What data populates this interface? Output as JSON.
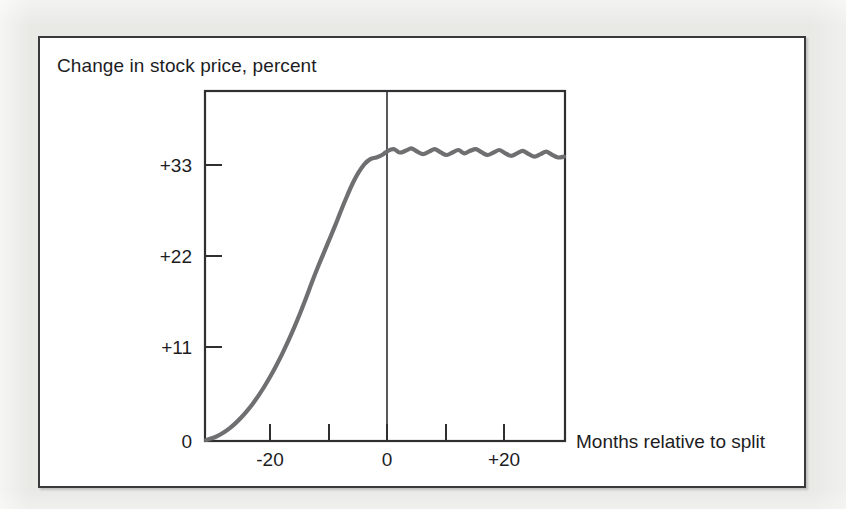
{
  "figure": {
    "background_color": "#e9e9e6",
    "panel_color": "#ffffff",
    "frame_color": "#3a3a3c"
  },
  "chart_data": {
    "type": "line",
    "title": "Change in stock price, percent",
    "xlabel": "Months relative to split",
    "ylabel": "Change in stock price, percent",
    "grid": false,
    "legend": "none",
    "line_color": "#6f6f72",
    "zero_line_label": "0",
    "xlim": [
      -29,
      32
    ],
    "ylim": [
      0,
      42
    ],
    "xticks": [
      -20,
      -10,
      0,
      10,
      20
    ],
    "xtick_labels": [
      "-20",
      "",
      "0",
      "+20",
      ""
    ],
    "xtick_labels_shown": [
      "-20",
      "0",
      "+20"
    ],
    "yticks": [
      0,
      11,
      22,
      33
    ],
    "ytick_labels": [
      "0",
      "+11",
      "+22",
      "+33"
    ],
    "x": [
      -29,
      -28,
      -27,
      -26,
      -25,
      -24,
      -23,
      -22,
      -21,
      -20,
      -19,
      -18,
      -17,
      -16,
      -15,
      -14,
      -13,
      -12,
      -11,
      -10,
      -9,
      -8,
      -7,
      -6,
      -5,
      -4,
      -3,
      -2,
      -1,
      0,
      1,
      2,
      3,
      4,
      5,
      6,
      7,
      8,
      9,
      10,
      11,
      12,
      13,
      14,
      15,
      16,
      17,
      18,
      19,
      20,
      21,
      22,
      23,
      24,
      25,
      26,
      27,
      28,
      29,
      30,
      31,
      32
    ],
    "values": [
      0.0,
      0.2,
      0.5,
      0.9,
      1.4,
      2.0,
      2.7,
      3.5,
      4.4,
      5.4,
      6.5,
      7.7,
      9.0,
      10.4,
      11.9,
      13.5,
      15.2,
      17.0,
      18.9,
      20.7,
      22.4,
      24.1,
      25.8,
      27.6,
      29.3,
      30.9,
      32.2,
      33.2,
      33.8,
      34.0,
      34.3,
      34.8,
      35.0,
      34.6,
      34.8,
      35.1,
      34.7,
      34.4,
      34.7,
      35.0,
      34.6,
      34.3,
      34.6,
      34.9,
      34.5,
      34.8,
      35.0,
      34.6,
      34.3,
      34.6,
      34.9,
      34.5,
      34.2,
      34.5,
      34.8,
      34.4,
      34.1,
      34.4,
      34.7,
      34.3,
      34.0,
      34.1
    ],
    "annotations": [
      {
        "type": "vertical-line",
        "x": 0,
        "label": "split date"
      }
    ]
  }
}
